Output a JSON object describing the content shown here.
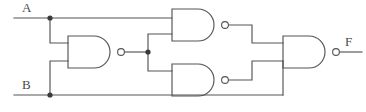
{
  "diagram": {
    "type": "logic-circuit",
    "canvas": {
      "width": 366,
      "height": 112,
      "background": "#ffffff"
    },
    "style": {
      "wire_color": "#545454",
      "gate_stroke": "#545454",
      "label_color": "#4a4a4a",
      "junction_color": "#3a3a3a",
      "stroke_width": 1.15
    },
    "labels": {
      "input_a": "A",
      "input_b": "B",
      "output_f": "F"
    },
    "label_positions": {
      "input_a": {
        "x": 22,
        "y": 12
      },
      "input_b": {
        "x": 22,
        "y": 89
      },
      "output_f": {
        "x": 345,
        "y": 46
      }
    },
    "gates": [
      {
        "id": "gate1",
        "name": "nand-gate-1",
        "kind": "NAND",
        "x": 68,
        "y": 36,
        "width": 48,
        "height": 32,
        "bubble_cx": 121,
        "bubble_cy": 52,
        "bubble_r": 3.4,
        "inputs": [
          "A",
          "B"
        ],
        "output": "nand1_out"
      },
      {
        "id": "gate2",
        "name": "nand-gate-2",
        "kind": "NAND",
        "x": 172,
        "y": 9,
        "width": 48,
        "height": 32,
        "bubble_cx": 225,
        "bubble_cy": 25,
        "bubble_r": 3.4,
        "inputs": [
          "A",
          "nand1_out"
        ],
        "output": "nand2_out"
      },
      {
        "id": "gate3",
        "name": "nand-gate-3",
        "kind": "NAND",
        "x": 172,
        "y": 64,
        "width": 48,
        "height": 32,
        "bubble_cx": 225,
        "bubble_cy": 80,
        "bubble_r": 3.4,
        "inputs": [
          "nand1_out",
          "B"
        ],
        "output": "nand3_out"
      },
      {
        "id": "gate4",
        "name": "nand-gate-4",
        "kind": "NAND",
        "x": 283,
        "y": 36,
        "width": 48,
        "height": 32,
        "bubble_cx": 336,
        "bubble_cy": 52,
        "bubble_r": 3.4,
        "inputs": [
          "nand2_out",
          "nand3_out"
        ],
        "output": "F"
      }
    ],
    "junctions": [
      {
        "name": "junction-a",
        "x": 50,
        "y": 18,
        "r": 2.6
      },
      {
        "name": "junction-b",
        "x": 50,
        "y": 95,
        "r": 2.6
      },
      {
        "name": "junction-nand1-out",
        "x": 148,
        "y": 52,
        "r": 2.6
      }
    ],
    "wires": [
      {
        "name": "wire-a-trunk",
        "d": "M 14 18 L 172 18"
      },
      {
        "name": "wire-a-branch-to-gate1",
        "d": "M 50 18 L 50 43 L 68 43"
      },
      {
        "name": "wire-b-trunk",
        "d": "M 14 95 L 283 95"
      },
      {
        "name": "wire-b-branch-to-gate1",
        "d": "M 50 95 L 50 61 L 68 61"
      },
      {
        "name": "wire-nand1-out-stub",
        "d": "M 124 52 L 148 52"
      },
      {
        "name": "wire-nand1-to-gate2",
        "d": "M 148 52 L 148 34 L 172 34"
      },
      {
        "name": "wire-nand1-to-gate3",
        "d": "M 148 52 L 148 71 L 172 71"
      },
      {
        "name": "wire-nand2-to-gate4",
        "d": "M 228 25 L 252 25 L 252 43 L 283 43"
      },
      {
        "name": "wire-nand3-to-gate4",
        "d": "M 228 80 L 252 80 L 252 61 L 283 61"
      },
      {
        "name": "wire-b-riser-to-gate4",
        "d": "M 283 95 L 283 61"
      },
      {
        "name": "wire-output-f",
        "d": "M 339 52 L 362 52"
      }
    ]
  }
}
